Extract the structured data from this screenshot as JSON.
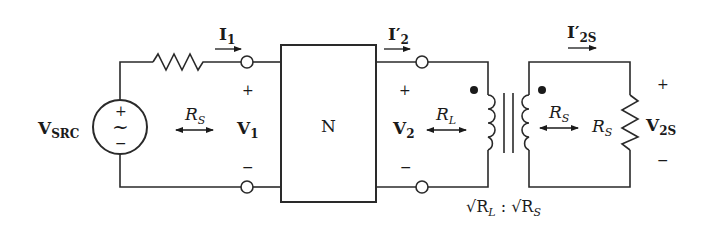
{
  "diagram": {
    "type": "circuit",
    "colors": {
      "wire": "#2a2a2a",
      "background": "#ffffff"
    },
    "source": {
      "name": "V",
      "sub": "SRC",
      "plus": "+",
      "minus": "−",
      "symbol": "~"
    },
    "source_resistor_current": {
      "name": "I",
      "sub": "1"
    },
    "port1": {
      "plus": "+",
      "minus": "−",
      "voltage_name": "V",
      "voltage_sub": "1",
      "impedance_name": "R",
      "impedance_sub": "S"
    },
    "network": {
      "label": "N"
    },
    "port2": {
      "current_name": "I′",
      "current_sub": "2",
      "plus": "+",
      "minus": "−",
      "voltage_name": "V",
      "voltage_sub": "2",
      "impedance_name": "R",
      "impedance_sub": "L"
    },
    "transformer": {
      "ratio_left": "√R",
      "ratio_left_sub": "L",
      "ratio_sep": " : ",
      "ratio_right": "√R",
      "ratio_right_sub": "S",
      "secondary_impedance_name": "R",
      "secondary_impedance_sub": "S"
    },
    "load": {
      "resistor_name": "R",
      "resistor_sub": "S",
      "current_name": "I′",
      "current_sub": "2S",
      "plus": "+",
      "minus": "−",
      "voltage_name": "V",
      "voltage_sub": "2S"
    }
  }
}
